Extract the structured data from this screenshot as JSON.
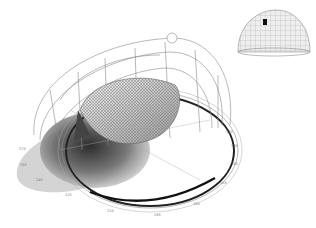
{
  "diagram": {
    "type": "solar-dome-analysis",
    "main_view": {
      "subject": "gridshell-canopy",
      "enclosure": "sky-dome-wireframe",
      "base": "compass-ring",
      "shadow": "cast-shadow"
    },
    "inset_view": {
      "subject": "sky-dome-hemisphere",
      "marker": "sun-position-marker"
    },
    "bearing_labels": [
      {
        "text": "120",
        "x": 226,
        "y": 130
      },
      {
        "text": "135",
        "x": 231,
        "y": 144
      },
      {
        "text": "150",
        "x": 231,
        "y": 162
      },
      {
        "text": "165",
        "x": 220,
        "y": 181
      },
      {
        "text": "180",
        "x": 193,
        "y": 202
      },
      {
        "text": "195",
        "x": 154,
        "y": 213
      },
      {
        "text": "210",
        "x": 107,
        "y": 209
      },
      {
        "text": "225",
        "x": 65,
        "y": 193
      },
      {
        "text": "240",
        "x": 36,
        "y": 178
      },
      {
        "text": "255",
        "x": 20,
        "y": 163
      },
      {
        "text": "270",
        "x": 19,
        "y": 147
      }
    ],
    "colors": {
      "line": "#8a8a8a",
      "dark": "#222222",
      "shadow": "#bdbdbd"
    }
  }
}
